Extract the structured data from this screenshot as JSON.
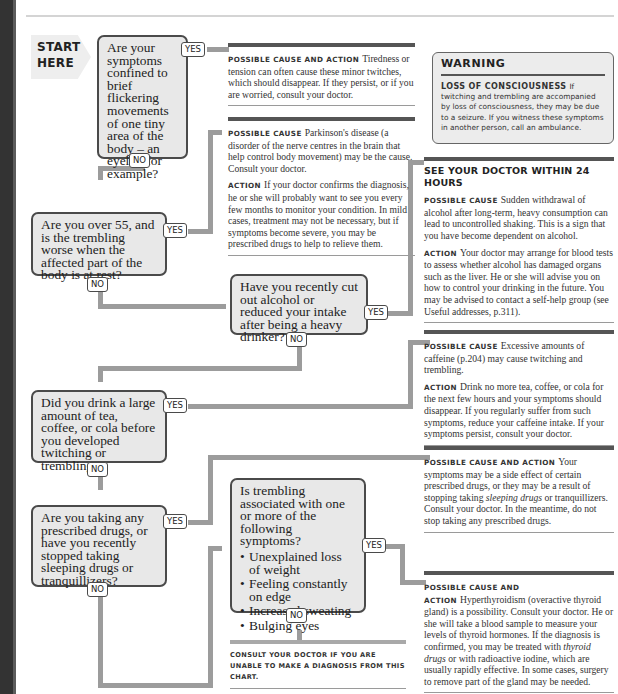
{
  "start": {
    "label": "START HERE"
  },
  "questions": [
    {
      "id": "q1",
      "text": "Are your symptoms confined to brief flickering movements of one tiny area of the body – an eyelid, for example?",
      "yes": "YES",
      "no": "NO"
    },
    {
      "id": "q2",
      "text": "Are you over 55, and is the trembling worse when the affected part of the body is at rest?",
      "yes": "YES",
      "no": "NO"
    },
    {
      "id": "q3",
      "text": "Have you recently cut out alcohol or reduced your intake after being a heavy drinker?",
      "yes": "YES",
      "no": "NO"
    },
    {
      "id": "q4",
      "text": "Did you drink a large amount of tea, coffee, or cola before you developed twitching or trembling?",
      "yes": "YES",
      "no": "NO"
    },
    {
      "id": "q5",
      "text": "Are you taking any prescribed drugs, or have you recently stopped taking sleeping drugs or tranquillizers?",
      "yes": "YES",
      "no": "NO"
    },
    {
      "id": "q6",
      "text": "Is trembling associated with one or more of the following symptoms?",
      "bullets": [
        "Unexplained loss of weight",
        "Feeling constantly on edge",
        "Increased sweating",
        "Bulging eyes"
      ],
      "yes": "YES",
      "no": "NO"
    }
  ],
  "answers": {
    "a1": {
      "label": "Possible cause and action",
      "text": "Tiredness or tension can often cause these minor twitches, which should disappear. If they persist, or if you are worried, consult your doctor."
    },
    "a2": {
      "cause_label": "Possible cause",
      "cause": "Parkinson's disease (a disorder of the nerve centres in the brain that help control body movement) may be the cause. Consult your doctor.",
      "action_label": "Action",
      "action": "If your doctor confirms the diagnosis, he or she will probably want to see you every few months to monitor your condition. In mild cases, treatment may not be necessary, but if symptoms become severe, you may be prescribed drugs to help to relieve them."
    },
    "a3": {
      "heading": "SEE YOUR DOCTOR WITHIN 24 HOURS",
      "cause_label": "Possible cause",
      "cause": "Sudden withdrawal of alcohol after long-term, heavy consumption can lead to uncontrolled shaking. This is a sign that you have become dependent on alcohol.",
      "action_label": "Action",
      "action": "Your doctor may arrange for blood tests to assess whether alcohol has damaged organs such as the liver. He or she will advise you on how to control your drinking in the future. You may be advised to contact a self-help group (see Useful addresses, p.311)."
    },
    "a4": {
      "cause_label": "Possible cause",
      "cause": "Excessive amounts of caffeine (p.204) may cause twitching and trembling.",
      "action_label": "Action",
      "action": "Drink no more tea, coffee, or cola for the next few hours and your symptoms should disappear. If you regularly suffer from such symptoms, reduce your caffeine intake. If your symptoms persist, consult your doctor."
    },
    "a5": {
      "label": "Possible cause and action",
      "text_1": "Your symptoms may be a side effect of certain prescribed drugs, or they may be a result of stopping taking",
      "italic": "sleeping drugs",
      "text_2": "or tranquillizers. Consult your doctor. In the meantime, do not stop taking any prescribed drugs."
    },
    "a6": {
      "label": "Possible cause and action",
      "text_1": "Hyperthyroidism (overactive thyroid gland) is a possibility. Consult your doctor. He or she will take a blood sample to measure your levels of thyroid hormones. If the diagnosis is confirmed, you may be treated with",
      "italic": "thyroid drugs",
      "text_2": "or with radioactive iodine, which are usually rapidly effective. In some cases, surgery to remove part of the gland may be needed."
    }
  },
  "warning": {
    "title": "WARNING",
    "label": "Loss of consciousness",
    "text": "If twitching and trembling are accompanied by loss of consciousness, they may be due to a seizure. If you witness these symptoms in another person, call an ambulance."
  },
  "footer": {
    "text": "Consult your doctor if you are unable to make a diagnosis from this chart."
  }
}
